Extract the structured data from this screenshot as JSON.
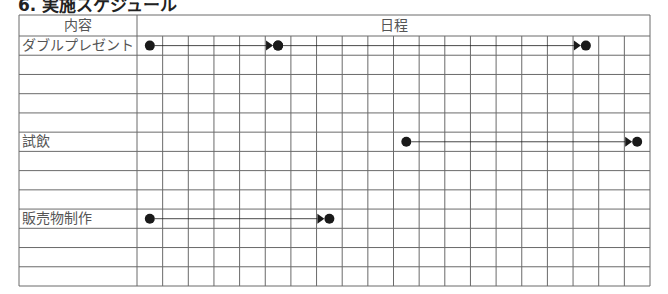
{
  "title": "6. 実施スケジュール",
  "table": {
    "header": {
      "content_label": "内容",
      "schedule_label": "日程"
    },
    "columns": 20,
    "rows": [
      {
        "label": "ダブルプレゼント",
        "tasks": [
          {
            "start": 0,
            "end": 5
          },
          {
            "start": 5,
            "end": 17
          }
        ]
      },
      {
        "label": "",
        "tasks": []
      },
      {
        "label": "",
        "tasks": []
      },
      {
        "label": "",
        "tasks": []
      },
      {
        "label": "",
        "tasks": []
      },
      {
        "label": "試飲",
        "tasks": [
          {
            "start": 10,
            "end": 19
          }
        ]
      },
      {
        "label": "",
        "tasks": []
      },
      {
        "label": "",
        "tasks": []
      },
      {
        "label": "",
        "tasks": []
      },
      {
        "label": "販売物制作",
        "tasks": [
          {
            "start": 0,
            "end": 7
          }
        ]
      },
      {
        "label": "",
        "tasks": []
      },
      {
        "label": "",
        "tasks": []
      },
      {
        "label": "",
        "tasks": []
      }
    ]
  },
  "colors": {
    "grid": "#6a6a6a",
    "marker": "#1a1a1a",
    "text": "#555555"
  }
}
